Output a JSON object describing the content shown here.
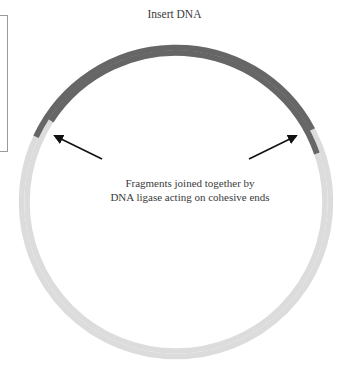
{
  "diagram": {
    "title": "Insert DNA",
    "caption_line1": "Fragments joined together by",
    "caption_line2": "DNA ligase acting on cohesive ends",
    "colors": {
      "insert": "#666666",
      "vector": "#dcdcdc",
      "arrow": "#111111",
      "text": "#3a3a3a"
    },
    "elements": [
      {
        "id": "insert-dna-arc",
        "type": "arc",
        "label": "Insert DNA",
        "color": "#666666"
      },
      {
        "id": "vector-dna-arc",
        "type": "arc",
        "color": "#dcdcdc"
      },
      {
        "id": "left-arrow",
        "type": "arrow",
        "points_to": "left cohesive-end junction"
      },
      {
        "id": "right-arrow",
        "type": "arrow",
        "points_to": "right cohesive-end junction"
      }
    ]
  }
}
